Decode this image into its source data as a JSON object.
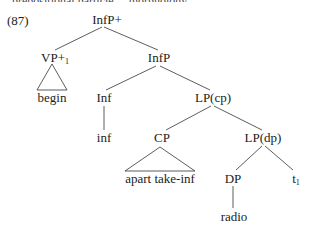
{
  "top_cutoff_text": "... prepositional particle ... morphology ...",
  "example_number": "(87)",
  "tree": {
    "root": "InfP+",
    "vp": "VP+",
    "vp_index": "1",
    "begin": "begin",
    "infp": "InfP",
    "inf_head": "Inf",
    "inf_leaf": "inf",
    "lp_cp": "LP(cp)",
    "cp": "CP",
    "cp_leaf": "apart take-inf",
    "lp_dp": "LP(dp)",
    "dp": "DP",
    "dp_leaf": "radio",
    "trace": "t",
    "trace_index": "1"
  },
  "colors": {
    "line": "#333333",
    "text": "#222222",
    "background": "#ffffff"
  }
}
